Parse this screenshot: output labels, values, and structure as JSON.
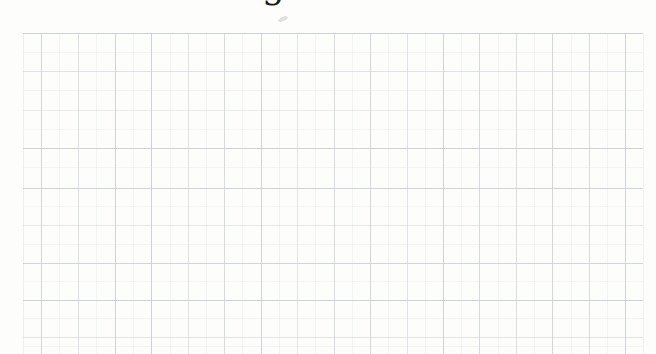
{
  "page": {
    "background": "#fdfdfc"
  },
  "heading": {
    "visible_glyph": "g",
    "glyph_color": "#1c1c1c"
  },
  "grid": {
    "area": {
      "left": 23,
      "top": 33,
      "right": 643,
      "bottom": 354
    },
    "major_color": "#c8cdd1",
    "minor_color": "#dcdfe2",
    "major_columns": [
      {
        "x": 41,
        "opacity": 0.8
      },
      {
        "x": 78,
        "opacity": 0.6
      },
      {
        "x": 115,
        "opacity": 0.85
      },
      {
        "x": 151,
        "opacity": 0.9
      },
      {
        "x": 188,
        "opacity": 0.55
      },
      {
        "x": 224,
        "opacity": 0.7
      },
      {
        "x": 261,
        "opacity": 0.85
      },
      {
        "x": 297,
        "opacity": 0.5
      },
      {
        "x": 334,
        "opacity": 0.7
      },
      {
        "x": 370,
        "opacity": 0.8
      },
      {
        "x": 407,
        "opacity": 0.55
      },
      {
        "x": 443,
        "opacity": 0.85
      },
      {
        "x": 479,
        "opacity": 0.75
      },
      {
        "x": 516,
        "opacity": 0.6
      },
      {
        "x": 552,
        "opacity": 0.8
      },
      {
        "x": 589,
        "opacity": 0.7
      },
      {
        "x": 625,
        "opacity": 0.85
      }
    ],
    "minor_columns": [
      {
        "x": 23,
        "opacity": 0.5
      },
      {
        "x": 59,
        "opacity": 0.3
      },
      {
        "x": 96,
        "opacity": 0.35
      },
      {
        "x": 133,
        "opacity": 0.3
      },
      {
        "x": 170,
        "opacity": 0.35
      },
      {
        "x": 206,
        "opacity": 0.3
      },
      {
        "x": 242,
        "opacity": 0.35
      },
      {
        "x": 279,
        "opacity": 0.4
      },
      {
        "x": 315,
        "opacity": 0.3
      },
      {
        "x": 352,
        "opacity": 0.35
      },
      {
        "x": 388,
        "opacity": 0.3
      },
      {
        "x": 425,
        "opacity": 0.35
      },
      {
        "x": 461,
        "opacity": 0.3
      },
      {
        "x": 498,
        "opacity": 0.35
      },
      {
        "x": 534,
        "opacity": 0.3
      },
      {
        "x": 571,
        "opacity": 0.35
      },
      {
        "x": 607,
        "opacity": 0.3
      },
      {
        "x": 643,
        "opacity": 0.4
      }
    ],
    "major_rows": [
      {
        "y": 33,
        "opacity": 0.9
      },
      {
        "y": 71,
        "opacity": 0.55
      },
      {
        "y": 110,
        "opacity": 0.35
      },
      {
        "y": 148,
        "opacity": 0.9
      },
      {
        "y": 188,
        "opacity": 0.85
      },
      {
        "y": 225,
        "opacity": 0.45
      },
      {
        "y": 263,
        "opacity": 0.8
      },
      {
        "y": 300,
        "opacity": 0.9
      },
      {
        "y": 337,
        "opacity": 0.5
      }
    ],
    "minor_rows": [
      {
        "y": 52,
        "opacity": 0.28
      },
      {
        "y": 90,
        "opacity": 0.28
      },
      {
        "y": 129,
        "opacity": 0.25
      },
      {
        "y": 167,
        "opacity": 0.28
      },
      {
        "y": 206,
        "opacity": 0.25
      },
      {
        "y": 244,
        "opacity": 0.28
      },
      {
        "y": 281,
        "opacity": 0.25
      },
      {
        "y": 318,
        "opacity": 0.28
      },
      {
        "y": 346,
        "opacity": 0.25
      }
    ]
  },
  "marks": [
    {
      "name": "paper-smudge-mark",
      "x": 278,
      "y": 17,
      "width": 10,
      "height": 4,
      "color": "#c6c6c6",
      "opacity": 0.55,
      "rotate": -25
    }
  ]
}
